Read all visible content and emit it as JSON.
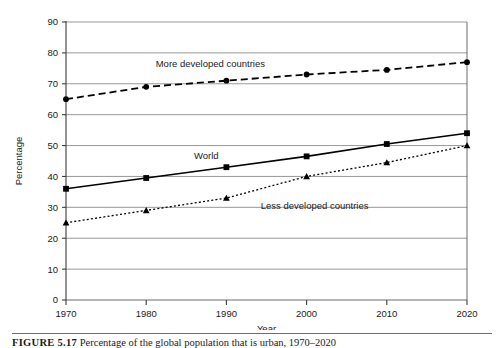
{
  "figure": {
    "caption_number": "FIGURE 5.17",
    "caption_text": "Percentage of the global population that is urban, 1970–2020"
  },
  "chart_data": {
    "type": "line",
    "title": "",
    "xlabel": "Year",
    "ylabel": "Percentage",
    "x": [
      1970,
      1980,
      1990,
      2000,
      2010,
      2020
    ],
    "xticklabels": [
      "1970",
      "1980",
      "1990",
      "2000",
      "2010",
      "2020"
    ],
    "xlim": [
      1970,
      2020
    ],
    "ylim": [
      0,
      90
    ],
    "yticks": [
      0,
      10,
      20,
      30,
      40,
      50,
      60,
      70,
      80,
      90
    ],
    "yticklabels": [
      "0",
      "10",
      "20",
      "30",
      "40",
      "50",
      "60",
      "70",
      "80",
      "90"
    ],
    "grid": "horizontal",
    "legend": "inline-labels",
    "series": [
      {
        "name": "More developed countries",
        "values": [
          65,
          69,
          71,
          73,
          74.5,
          77
        ],
        "marker": "circle",
        "linestyle": "dashed",
        "color": "#000000",
        "label_x": 1988,
        "label_y": 75.5
      },
      {
        "name": "World",
        "values": [
          36,
          39.5,
          43,
          46.5,
          50.5,
          54
        ],
        "marker": "square",
        "linestyle": "solid",
        "color": "#000000",
        "label_x": 1987.5,
        "label_y": 45.5
      },
      {
        "name": "Less developed countries",
        "values": [
          25,
          29,
          33,
          40,
          44.5,
          50
        ],
        "marker": "triangle",
        "linestyle": "dotted",
        "color": "#000000",
        "label_x": 2001,
        "label_y": 29.5
      }
    ]
  }
}
